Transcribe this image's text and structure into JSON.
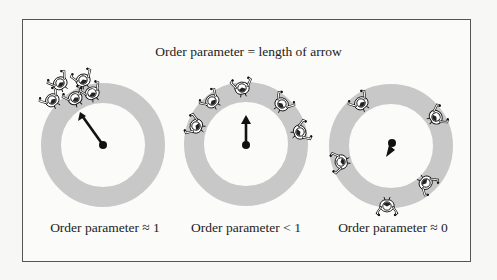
{
  "figure": {
    "title": "Order parameter = length of arrow",
    "panels": [
      {
        "id": "synchronized",
        "caption": "Order parameter ≈ 1",
        "ring_center": [
          103,
          145
        ],
        "arrow": "long-up-left"
      },
      {
        "id": "partial",
        "caption": "Order parameter <  1",
        "ring_center": [
          246,
          144
        ],
        "arrow": "short-up"
      },
      {
        "id": "incoherent",
        "caption": "Order parameter ≈ 0",
        "ring_center": [
          391,
          146
        ],
        "arrow": "tiny-down-left"
      }
    ],
    "colors": {
      "ring": "#c8c8c8",
      "frame": "#555555",
      "arrow": "#111111",
      "text": "#222222"
    },
    "icons": {
      "person": "person-top-view-icon",
      "arrow": "arrow-icon"
    }
  }
}
